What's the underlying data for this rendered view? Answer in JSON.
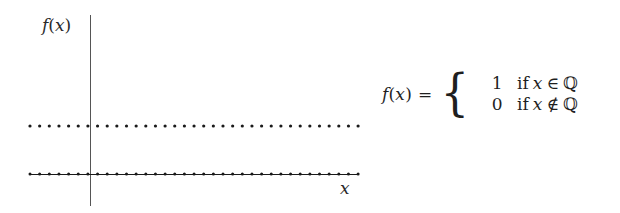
{
  "figure": {
    "kind": "dirichlet-function-plot",
    "background_color": "#ffffff",
    "ink_color": "#1a1a1a",
    "axis_color": "#555555"
  },
  "axes": {
    "y_axis_label": "f(x)",
    "y_axis_label_parts": {
      "f": "f",
      "open": "(",
      "var": "x",
      "close": ")"
    },
    "x_axis_label": "x",
    "y_axis_x_px": 90,
    "y_axis_top_px": 15,
    "y_axis_bottom_px": 206,
    "x_axis_y_px": 174,
    "x_axis_left_px": 30,
    "x_axis_right_px": 358
  },
  "formula": {
    "lhs": "f(x)",
    "lhs_parts": {
      "f": "f",
      "open": "(",
      "var": "x",
      "close": ")"
    },
    "equals": "=",
    "brace": "{",
    "cases": [
      {
        "value": "1",
        "keyword": "if",
        "variable": "x",
        "relation": "∈",
        "set": "ℚ",
        "text": "if x ∈ ℚ"
      },
      {
        "value": "0",
        "keyword": "if",
        "variable": "x",
        "relation": "∉",
        "set": "ℚ",
        "text": "if x ∉ ℚ"
      }
    ]
  },
  "chart_data": {
    "type": "scatter",
    "title": "",
    "xlabel": "x",
    "ylabel": "f(x)",
    "xlim": [
      -1,
      1
    ],
    "ylim": [
      0,
      1
    ],
    "grid": false,
    "legend": null,
    "annotations": [
      "f(x) = 1 if x ∈ ℚ",
      "f(x) = 0 if x ∉ ℚ"
    ],
    "series": [
      {
        "name": "f(x) = 1 (rational x)",
        "y_value": 1,
        "style": "dotted",
        "connected": false,
        "marker": "filled-circle",
        "marker_size_px": 3.2,
        "point_count": 35,
        "x_start_px": 30,
        "x_end_px": 358,
        "x_step_px": 9.65,
        "y_px": 126,
        "color": "#1a1a1a"
      },
      {
        "name": "f(x) = 0 (irrational x)",
        "y_value": 0,
        "style": "solid-line-with-dots",
        "connected": true,
        "marker": "filled-circle",
        "marker_size_px": 3.0,
        "point_count": 35,
        "x_start_px": 30,
        "x_end_px": 358,
        "x_step_px": 9.65,
        "y_px": 174,
        "color": "#1a1a1a"
      }
    ]
  }
}
